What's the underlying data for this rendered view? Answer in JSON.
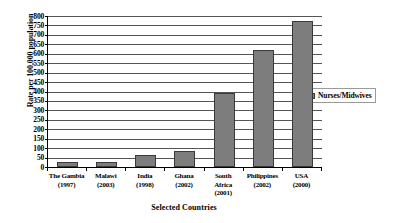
{
  "chart_data": {
    "type": "bar",
    "title": "",
    "xlabel": "Selected Countries",
    "ylabel": "Rate per 100,000 population",
    "ylim": [
      0,
      800
    ],
    "ytick_step": 50,
    "grid": true,
    "legend_position": "right",
    "categories": [
      "The Gambia (1997)",
      "Malawi (2003)",
      "India (1998)",
      "Ghana (2002)",
      "South Africa (2001)",
      "Philippines (2002)",
      "USA (2000)"
    ],
    "category_lines": [
      [
        "The Gambia",
        "(1997)"
      ],
      [
        "Malawi",
        "(2003)"
      ],
      [
        "India",
        "(1998)"
      ],
      [
        "Ghana",
        "(2002)"
      ],
      [
        "South",
        "Africa",
        "(2001)"
      ],
      [
        "Philippines",
        "(2002)"
      ],
      [
        "USA",
        "(2000)"
      ]
    ],
    "series": [
      {
        "name": "Nurses/Midwives",
        "values": [
          25,
          28,
          63,
          85,
          390,
          620,
          775
        ],
        "color": "#7d7d7d"
      }
    ],
    "ytick_labels": [
      "800",
      "750",
      "700",
      "650",
      "600",
      "550",
      "500",
      "450",
      "400",
      "350",
      "300",
      "250",
      "200",
      "150",
      "100",
      "50",
      "0"
    ]
  },
  "legend": {
    "entries": [
      {
        "label": "Nurses/Midwives",
        "color": "#7d7d7d"
      }
    ]
  }
}
